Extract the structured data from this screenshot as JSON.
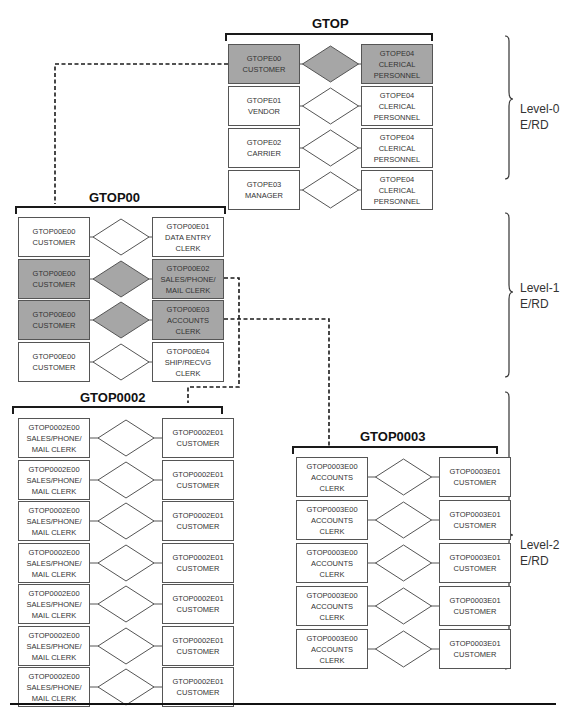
{
  "colors": {
    "highlight_fill": "#a6a6a6",
    "line": "#555555",
    "dashed": "#1a1a1a"
  },
  "groups": {
    "gtop": {
      "title": "GTOP",
      "rows": [
        {
          "left": [
            "GTOPE00",
            "CUSTOMER"
          ],
          "right": [
            "GTOPE04",
            "CLERICAL",
            "PERSONNEL"
          ],
          "highlighted": true
        },
        {
          "left": [
            "GTOPE01",
            "VENDOR"
          ],
          "right": [
            "GTOPE04",
            "CLERICAL",
            "PERSONNEL"
          ],
          "highlighted": false
        },
        {
          "left": [
            "GTOPE02",
            "CARRIER"
          ],
          "right": [
            "GTOPE04",
            "CLERICAL",
            "PERSONNEL"
          ],
          "highlighted": false
        },
        {
          "left": [
            "GTOPE03",
            "MANAGER"
          ],
          "right": [
            "GTOPE04",
            "CLERICAL",
            "PERSONNEL"
          ],
          "highlighted": false
        }
      ]
    },
    "gtop00": {
      "title": "GTOP00",
      "rows": [
        {
          "left": [
            "GTOP00E00",
            "CUSTOMER"
          ],
          "right": [
            "GTOP00E01",
            "DATA ENTRY",
            "CLERK"
          ],
          "highlighted": false
        },
        {
          "left": [
            "GTOP00E00",
            "CUSTOMER"
          ],
          "right": [
            "GTOP00E02",
            "SALES/PHONE/",
            "MAIL CLERK"
          ],
          "highlighted": true
        },
        {
          "left": [
            "GTOP00E00",
            "CUSTOMER"
          ],
          "right": [
            "GTOP00E03",
            "ACCOUNTS",
            "CLERK"
          ],
          "highlighted": true
        },
        {
          "left": [
            "GTOP00E00",
            "CUSTOMER"
          ],
          "right": [
            "GTOP00E04",
            "SHIP/RECVG",
            "CLERK"
          ],
          "highlighted": false
        }
      ]
    },
    "gtop0002": {
      "title": "GTOP0002",
      "rows": [
        {
          "left": [
            "GTOP0002E00",
            "SALES/PHONE/",
            "MAIL CLERK"
          ],
          "right": [
            "GTOP0002E01",
            "CUSTOMER"
          ],
          "highlighted": false
        },
        {
          "left": [
            "GTOP0002E00",
            "SALES/PHONE/",
            "MAIL CLERK"
          ],
          "right": [
            "GTOP0002E01",
            "CUSTOMER"
          ],
          "highlighted": false
        },
        {
          "left": [
            "GTOP0002E00",
            "SALES/PHONE/",
            "MAIL CLERK"
          ],
          "right": [
            "GTOP0002E01",
            "CUSTOMER"
          ],
          "highlighted": false
        },
        {
          "left": [
            "GTOP0002E00",
            "SALES/PHONE/",
            "MAIL CLERK"
          ],
          "right": [
            "GTOP0002E01",
            "CUSTOMER"
          ],
          "highlighted": false
        },
        {
          "left": [
            "GTOP0002E00",
            "SALES/PHONE/",
            "MAIL CLERK"
          ],
          "right": [
            "GTOP0002E01",
            "CUSTOMER"
          ],
          "highlighted": false
        },
        {
          "left": [
            "GTOP0002E00",
            "SALES/PHONE/",
            "MAIL CLERK"
          ],
          "right": [
            "GTOP0002E01",
            "CUSTOMER"
          ],
          "highlighted": false
        },
        {
          "left": [
            "GTOP0002E00",
            "SALES/PHONE/",
            "MAIL CLERK"
          ],
          "right": [
            "GTOP0002E01",
            "CUSTOMER"
          ],
          "highlighted": false
        }
      ]
    },
    "gtop0003": {
      "title": "GTOP0003",
      "rows": [
        {
          "left": [
            "GTOP0003E00",
            "ACCOUNTS",
            "CLERK"
          ],
          "right": [
            "GTOP0003E01",
            "CUSTOMER"
          ],
          "highlighted": false
        },
        {
          "left": [
            "GTOP0003E00",
            "ACCOUNTS",
            "CLERK"
          ],
          "right": [
            "GTOP0003E01",
            "CUSTOMER"
          ],
          "highlighted": false
        },
        {
          "left": [
            "GTOP0003E00",
            "ACCOUNTS",
            "CLERK"
          ],
          "right": [
            "GTOP0003E01",
            "CUSTOMER"
          ],
          "highlighted": false
        },
        {
          "left": [
            "GTOP0003E00",
            "ACCOUNTS",
            "CLERK"
          ],
          "right": [
            "GTOP0003E01",
            "CUSTOMER"
          ],
          "highlighted": false
        },
        {
          "left": [
            "GTOP0003E00",
            "ACCOUNTS",
            "CLERK"
          ],
          "right": [
            "GTOP0003E01",
            "CUSTOMER"
          ],
          "highlighted": false
        }
      ]
    }
  },
  "levels": [
    {
      "line1": "Level-0",
      "line2": "E/RD"
    },
    {
      "line1": "Level-1",
      "line2": "E/RD"
    },
    {
      "line1": "Level-2",
      "line2": "E/RD"
    }
  ]
}
